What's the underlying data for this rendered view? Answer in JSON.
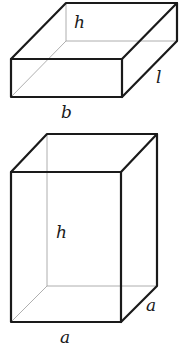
{
  "figure": {
    "top_box": {
      "name": "flat cuboid",
      "labels": {
        "height": "h",
        "length": "l",
        "breadth": "b"
      }
    },
    "bottom_box": {
      "name": "square-based tall cuboid",
      "labels": {
        "height": "h",
        "depth": "a",
        "width": "a"
      }
    },
    "colors": {
      "edge": "#1a1a1a",
      "hidden_edge": "#9a9a9a",
      "background": "#ffffff"
    }
  }
}
